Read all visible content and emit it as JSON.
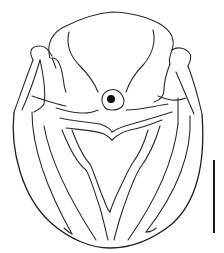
{
  "figure": {
    "subject": "dorsal view line drawing of insect body",
    "stroke_color": "#2a2a2a",
    "background_color": "#ffffff",
    "scale_bar": {
      "x": 214,
      "y_start": 160,
      "y_end": 233,
      "color": "#1a1a1a"
    },
    "parts": [
      "head",
      "pronotum",
      "left-lateral-lobe",
      "right-lateral-lobe",
      "scutellum-pit",
      "transverse-band",
      "abdomen",
      "median-v-ridge"
    ]
  }
}
